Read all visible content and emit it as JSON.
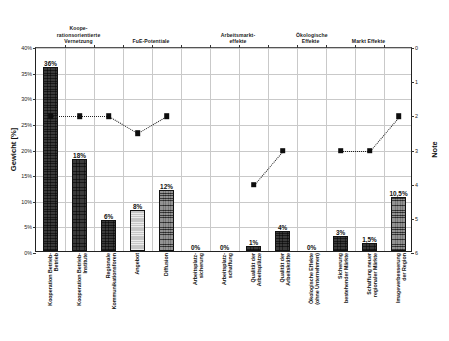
{
  "chart_data": {
    "type": "bar",
    "title": "",
    "ylabel": "Gewicht [%]",
    "ylabel_right": "Note",
    "xlabel": "",
    "ylim": [
      0,
      40
    ],
    "ylim_right": [
      6,
      0
    ],
    "grid": true,
    "legend": "none",
    "y_ticks": [
      "0%",
      "5%",
      "10%",
      "15%",
      "20%",
      "25%",
      "30%",
      "35%",
      "40%"
    ],
    "y_ticks_right": [
      "0",
      "1",
      "2",
      "3",
      "4",
      "5",
      "6"
    ],
    "groups": [
      {
        "label": "Koope-\nrationsorientierte\nVernetzung",
        "start": 0,
        "end": 2
      },
      {
        "label": "FuE-Potentiale",
        "start": 3,
        "end": 4
      },
      {
        "label": "Arbeitsmarkt-\neffekte",
        "start": 5,
        "end": 8
      },
      {
        "label": "Ökologische\nEffekte",
        "start": 9,
        "end": 9
      },
      {
        "label": "Markt Effekte",
        "start": 10,
        "end": 12
      }
    ],
    "categories": [
      "Kooperation Betrieb-\nBetrieb",
      "Kooperation Betrieb-\nInstitute",
      "Regionale\nKommunikationsforen",
      "Angebot",
      "Diffusion",
      "Arbeitsplatz-\nsicherung",
      "Arbeitsplatz-\nschaffung",
      "Qualität der\nArbeitsplätze",
      "Qualität der\nArbeitskräfte",
      "Ökologische Effekte\n(ohne Unternehmen)",
      "Sicherung\nbestehender Märkte",
      "Schaffung neuer\nregionaler Märkte",
      "Imageverbesserung\nder Region"
    ],
    "series": [
      {
        "name": "Gewicht [%]",
        "axis": "left",
        "values": [
          36,
          18,
          6,
          8,
          12,
          0,
          0,
          1,
          4,
          0,
          3,
          1.5,
          10.5
        ],
        "value_labels": [
          "36%",
          "18%",
          "6%",
          "8%",
          "12%",
          "0%",
          "0%",
          "1%",
          "4%",
          "0%",
          "3%",
          "1,5%",
          "10,5%"
        ],
        "shades": [
          "dark",
          "dark",
          "dark",
          "light",
          "mid",
          "none",
          "none",
          "dark",
          "dark",
          "none",
          "dark",
          "dark",
          "mid"
        ]
      },
      {
        "name": "Note",
        "axis": "right",
        "marker": "square",
        "line": "dotted",
        "values": [
          2,
          2,
          2,
          2.5,
          2,
          null,
          null,
          4,
          3,
          null,
          3,
          3,
          2
        ]
      }
    ]
  }
}
